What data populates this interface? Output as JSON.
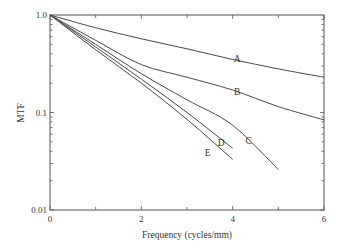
{
  "chart_data": {
    "type": "line",
    "title": "",
    "xlabel": "Frequency (cycles/mm)",
    "ylabel": "MTF",
    "xlim": [
      0,
      6
    ],
    "ylim": [
      0.01,
      1.0
    ],
    "yscale": "log",
    "grid": false,
    "legend": "inline labels",
    "x_ticks": [
      0,
      2,
      4,
      6
    ],
    "x_tick_labels": [
      "0",
      "2",
      "4",
      "6"
    ],
    "y_ticks": [
      0.01,
      0.1,
      1.0
    ],
    "y_tick_labels": [
      "0.01",
      "0.1",
      "1.0"
    ],
    "series": [
      {
        "name": "A",
        "x": [
          0,
          1,
          2,
          3,
          4,
          5,
          6
        ],
        "values": [
          1.0,
          0.74,
          0.57,
          0.45,
          0.35,
          0.28,
          0.23
        ],
        "label_pos": [
          4.1,
          0.33
        ]
      },
      {
        "name": "B",
        "x": [
          0,
          1,
          2,
          3,
          4,
          5,
          6
        ],
        "values": [
          1.0,
          0.55,
          0.31,
          0.23,
          0.17,
          0.115,
          0.084
        ],
        "label_pos": [
          4.1,
          0.15
        ]
      },
      {
        "name": "C",
        "x": [
          0,
          1,
          2,
          3,
          4,
          5
        ],
        "values": [
          1.0,
          0.5,
          0.25,
          0.135,
          0.074,
          0.026
        ],
        "label_pos": [
          4.35,
          0.048
        ]
      },
      {
        "name": "D",
        "x": [
          0,
          1,
          2,
          3,
          4
        ],
        "values": [
          1.0,
          0.47,
          0.22,
          0.1,
          0.043
        ],
        "label_pos": [
          3.75,
          0.045
        ]
      },
      {
        "name": "E",
        "x": [
          0,
          1,
          2,
          3,
          4
        ],
        "values": [
          1.0,
          0.44,
          0.2,
          0.085,
          0.033
        ],
        "label_pos": [
          3.45,
          0.036
        ]
      }
    ]
  },
  "labels": {
    "xlabel": "Frequency (cycles/mm)",
    "ylabel": "MTF"
  }
}
